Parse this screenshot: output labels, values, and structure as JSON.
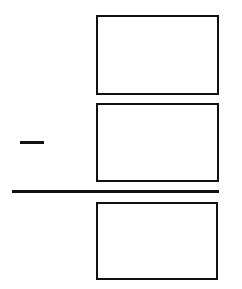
{
  "worksheet": {
    "operation": "subtraction",
    "operator_symbol": "−",
    "colors": {
      "ink": "#111111",
      "background": "#ffffff"
    },
    "boxes": [
      {
        "role": "minuend",
        "value": ""
      },
      {
        "role": "subtrahend",
        "value": ""
      },
      {
        "role": "difference",
        "value": ""
      }
    ]
  }
}
